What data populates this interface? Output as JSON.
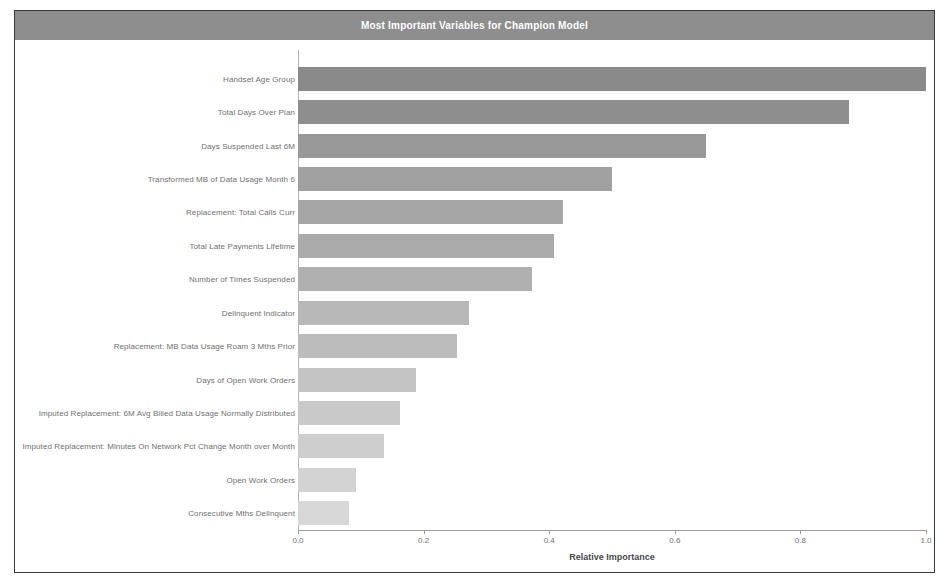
{
  "chart": {
    "title": "Most Important Variables for Champion Model",
    "title_bar_color": "#8e8e8e"
  },
  "chart_data": {
    "type": "bar",
    "orientation": "horizontal",
    "title": "Most Important Variables for Champion Model",
    "xlabel": "Relative Importance",
    "ylabel": "",
    "xlim": [
      0.0,
      1.0
    ],
    "grid": false,
    "legend": "none",
    "xticks": [
      "0.0",
      "0.2",
      "0.4",
      "0.6",
      "0.8",
      "1.0"
    ],
    "xtick_values": [
      0.0,
      0.2,
      0.4,
      0.6,
      0.8,
      1.0
    ],
    "categories": [
      "Handset Age Group",
      "Total Days Over Plan",
      "Days Suspended Last 6M",
      "Transformed MB of Data Usage Month 6",
      "Replacement: Total Calls Curr",
      "Total Late Payments Lifetime",
      "Number of Times Suspended",
      "Delinquent Indicator",
      "Replacement: MB Data Usage Roam 3 Mths Prior",
      "Days of Open Work Orders",
      "Imputed Replacement: 6M Avg Billed Data Usage Normally Distributed",
      "Imputed Replacement: Minutes On Network Pct Change Month over Month",
      "Open Work Orders",
      "Consecutive Mths Delinquent"
    ],
    "values": [
      1.0,
      0.878,
      0.65,
      0.5,
      0.422,
      0.408,
      0.373,
      0.272,
      0.253,
      0.188,
      0.163,
      0.137,
      0.093,
      0.081
    ],
    "bar_colors": [
      "#8a8a8a",
      "#8e8e8e",
      "#999999",
      "#a0a0a0",
      "#a6a6a6",
      "#aaaaaa",
      "#b0b0b0",
      "#b8b8b8",
      "#bcbcbc",
      "#c4c4c4",
      "#c9c9c9",
      "#cdcdcd",
      "#d3d3d3",
      "#d7d7d7"
    ]
  }
}
